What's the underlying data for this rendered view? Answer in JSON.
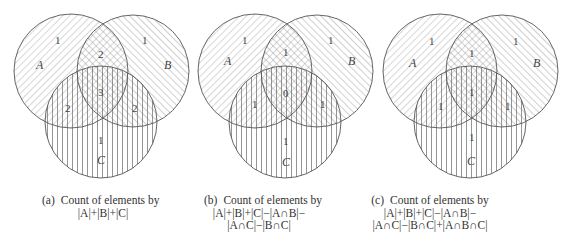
{
  "panels": [
    {
      "tag": "(a)",
      "caption_line1": "Count of elements by",
      "formula_lines": [
        "|A|+|B|+|C|"
      ],
      "labels": {
        "A": "A",
        "B": "B",
        "C": "C"
      },
      "region_counts": {
        "A_only": "1",
        "B_only": "1",
        "C_only": "1",
        "AB_only": "2",
        "AC_only": "2",
        "BC_only": "2",
        "ABC": "3"
      }
    },
    {
      "tag": "(b)",
      "caption_line1": "Count of elements by",
      "formula_lines": [
        "|A|+|B|+|C|−|A∩B|−",
        "|A∩C|−|B∩C|"
      ],
      "labels": {
        "A": "A",
        "B": "B",
        "C": "C"
      },
      "region_counts": {
        "A_only": "1",
        "B_only": "1",
        "C_only": "1",
        "AB_only": "1",
        "AC_only": "1",
        "BC_only": "1",
        "ABC": "0"
      }
    },
    {
      "tag": "(c)",
      "caption_line1": "Count of elements by",
      "formula_lines": [
        "|A|+|B|+|C|−|A∩B|−",
        "|A∩C|−|B∩C|+|A∩B∩C|"
      ],
      "labels": {
        "A": "A",
        "B": "B",
        "C": "C"
      },
      "region_counts": {
        "A_only": "1",
        "B_only": "1",
        "C_only": "1",
        "AB_only": "1",
        "AC_only": "1",
        "BC_only": "1",
        "ABC": "1"
      }
    }
  ],
  "colors": {
    "stroke": "#555555",
    "hatch": "#8a8a8a",
    "background": "#ffffff"
  }
}
